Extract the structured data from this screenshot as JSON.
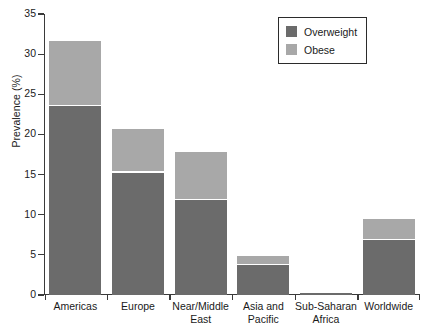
{
  "chart_data": {
    "type": "bar",
    "subtype": "stacked-bar",
    "title": "",
    "xlabel": "",
    "ylabel": "Prevalence (%)",
    "ylim": [
      0,
      35
    ],
    "ytick_step": 5,
    "yticks": [
      0,
      5,
      10,
      15,
      20,
      25,
      30,
      35
    ],
    "ytick_labels": [
      "0",
      "5",
      "10",
      "15",
      "20",
      "25",
      "30",
      "35"
    ],
    "grid": false,
    "legend_position": "top-right",
    "categories": [
      "Americas",
      "Europe",
      "Near/Middle East",
      "Asia and Pacific",
      "Sub-Saharan Africa",
      "Worldwide"
    ],
    "category_lines": [
      [
        "Americas"
      ],
      [
        "Europe"
      ],
      [
        "Near/Middle",
        "East"
      ],
      [
        "Asia and",
        "Pacific"
      ],
      [
        "Sub-Saharan",
        "Africa"
      ],
      [
        "Worldwide"
      ]
    ],
    "series": [
      {
        "name": "Overweight",
        "color": "#6b6b6b",
        "values": [
          23.6,
          15.3,
          11.9,
          3.8,
          0.2,
          6.9
        ]
      },
      {
        "name": "Obese",
        "color": "#a8a8a8",
        "values": [
          8.1,
          5.4,
          5.9,
          1.1,
          0.1,
          2.6
        ]
      }
    ],
    "totals": [
      31.7,
      20.7,
      17.8,
      4.9,
      0.3,
      9.5
    ]
  },
  "legend": {
    "items": [
      {
        "label": "Overweight",
        "color": "#6b6b6b",
        "swatch": "overweight-swatch"
      },
      {
        "label": "Obese",
        "color": "#a8a8a8",
        "swatch": "obese-swatch"
      }
    ]
  },
  "axes": {
    "y_title": "Prevalence (%)"
  },
  "colors": {
    "overweight": "#6b6b6b",
    "obese": "#a8a8a8",
    "axis": "#3a3a3a",
    "background": "#ffffff"
  }
}
